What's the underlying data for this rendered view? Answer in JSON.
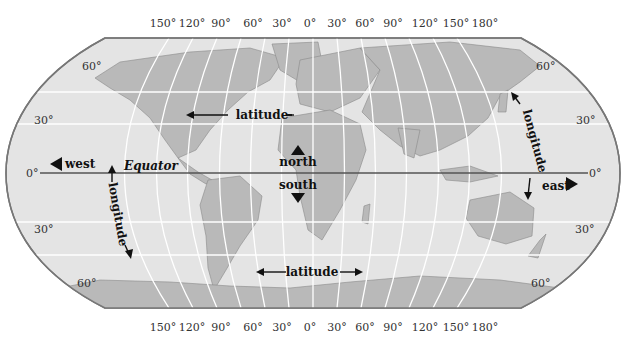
{
  "diagram": {
    "colors": {
      "ocean": "#e4e4e4",
      "land": "#b9b9b9",
      "grid": "#ffffff",
      "outline": "#777777",
      "equator": "#555555",
      "text": "#111111"
    },
    "top_longitude_ticks": [
      "150°",
      "120°",
      "90°",
      "60°",
      "30°",
      "0°",
      "30°",
      "60°",
      "90°",
      "120°",
      "150°",
      "180°"
    ],
    "bottom_longitude_ticks": [
      "150°",
      "120°",
      "90°",
      "60°",
      "30°",
      "0°",
      "30°",
      "60°",
      "90°",
      "120°",
      "150°",
      "180°"
    ],
    "left_latitude_ticks": [
      "60°",
      "30°",
      "0°",
      "30°",
      "60°"
    ],
    "right_latitude_ticks": [
      "60°",
      "30°",
      "0°",
      "30°",
      "60°"
    ],
    "labels": {
      "west": "west",
      "east": "east",
      "north": "north",
      "south": "south",
      "equator": "Equator",
      "latitude_top": "latitude",
      "latitude_bottom": "latitude",
      "longitude_left": "longitude",
      "longitude_right": "longitude"
    }
  }
}
